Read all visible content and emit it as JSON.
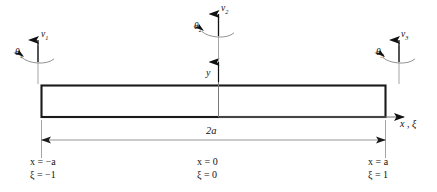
{
  "figure": {
    "type": "beam-element-diagram",
    "colors": {
      "beam_outline": "#1a1a1a",
      "axis_line": "#6e6e6e",
      "dimension_line": "#8a8a8a",
      "text": "#111111",
      "background": "#ffffff"
    }
  },
  "nodes": [
    {
      "id": "node-1",
      "displacement": "v",
      "displacement_index": "1",
      "rotation": "θ",
      "rotation_index": "1"
    },
    {
      "id": "node-2",
      "displacement": "v",
      "displacement_index": "2",
      "rotation": "θ",
      "rotation_index": "2"
    },
    {
      "id": "node-3",
      "displacement": "v",
      "displacement_index": "3",
      "rotation": "θ",
      "rotation_index": "3"
    }
  ],
  "axes": {
    "vertical_label": "y",
    "horizontal_label": "x ,  ξ"
  },
  "dimension": {
    "label": "2a"
  },
  "coordinate_labels": [
    {
      "id": "left",
      "x_text": "x = −a",
      "xi_text": "ξ = −1"
    },
    {
      "id": "center",
      "x_text": "x = 0",
      "xi_text": "ξ = 0"
    },
    {
      "id": "right",
      "x_text": "x = a",
      "xi_text": "ξ = 1"
    }
  ]
}
